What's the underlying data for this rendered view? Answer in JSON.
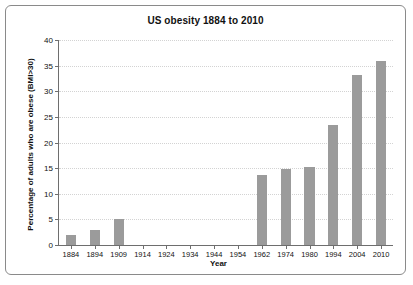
{
  "chart_data": {
    "type": "bar",
    "title": "US obesity 1884 to 2010",
    "xlabel": "Year",
    "ylabel": "Percentage of adults who are obese (BMI>30)",
    "categories": [
      "1884",
      "1894",
      "1909",
      "1914",
      "1924",
      "1934",
      "1944",
      "1954",
      "1962",
      "1974",
      "1980",
      "1994",
      "2004",
      "2010"
    ],
    "values": [
      2,
      3,
      5,
      null,
      null,
      null,
      null,
      null,
      13.7,
      14.8,
      15.2,
      23.5,
      33.2,
      36
    ],
    "ylim": [
      0,
      40
    ],
    "yticks": [
      0,
      5,
      10,
      15,
      20,
      25,
      30,
      35,
      40
    ],
    "ytick_labels": [
      "0",
      "5",
      "10",
      "15",
      "20",
      "25",
      "30",
      "35",
      "40"
    ],
    "grid": true,
    "legend": "none",
    "bar_color": "#9b9b9b",
    "grid_color": "#d3d3d3",
    "axis_color": "#6e6e6e"
  }
}
